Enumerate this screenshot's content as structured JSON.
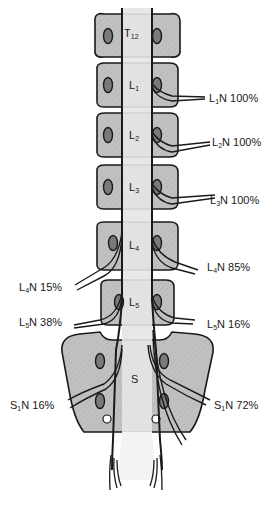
{
  "diagram": {
    "colors": {
      "bone": "#bdbdbd",
      "bone_outline": "#1a1a1a",
      "canal": "#e6e6e6",
      "foramen": "#7a7a7a",
      "nerve": "#1a1a1a",
      "background": "#ffffff"
    },
    "vertebrae": [
      {
        "id": "T12",
        "letter": "T",
        "sub": "12"
      },
      {
        "id": "L1",
        "letter": "L",
        "sub": "1"
      },
      {
        "id": "L2",
        "letter": "L",
        "sub": "2"
      },
      {
        "id": "L3",
        "letter": "L",
        "sub": "3"
      },
      {
        "id": "L4",
        "letter": "L",
        "sub": "4"
      },
      {
        "id": "L5",
        "letter": "L",
        "sub": "5"
      },
      {
        "id": "S",
        "letter": "S",
        "sub": ""
      }
    ],
    "nerve_labels": {
      "right": [
        {
          "root": "L",
          "sub": "1",
          "suffix": "N",
          "value": "100%"
        },
        {
          "root": "L",
          "sub": "2",
          "suffix": "N",
          "value": "100%"
        },
        {
          "root": "L",
          "sub": "3",
          "suffix": "N",
          "value": "100%"
        },
        {
          "root": "L",
          "sub": "4",
          "suffix": "N",
          "value": "85%"
        },
        {
          "root": "L",
          "sub": "5",
          "suffix": "N",
          "value": "16%"
        },
        {
          "root": "S",
          "sub": "1",
          "suffix": "N",
          "value": "72%"
        }
      ],
      "left": [
        {
          "root": "L",
          "sub": "4",
          "suffix": "N",
          "value": "15%"
        },
        {
          "root": "L",
          "sub": "5",
          "suffix": "N",
          "value": "38%"
        },
        {
          "root": "S",
          "sub": "1",
          "suffix": "N",
          "value": "16%"
        }
      ]
    }
  }
}
